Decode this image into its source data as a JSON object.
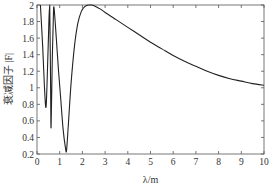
{
  "chart_data": {
    "type": "line",
    "title": "",
    "xlabel": "λ/m",
    "ylabel": "衰减因子 |F|",
    "xlim": [
      0,
      10
    ],
    "ylim": [
      0.2,
      2
    ],
    "xticks": [
      0,
      1,
      2,
      3,
      4,
      5,
      6,
      7,
      8,
      9,
      10
    ],
    "yticks": [
      0.2,
      0.4,
      0.6,
      0.8,
      1,
      1.2,
      1.4,
      1.6,
      1.8,
      2
    ],
    "ytick_labels": [
      "0.2",
      "0.4",
      "0.6",
      "0.8",
      "1",
      "1.2",
      "1.4",
      "1.6",
      "1.8",
      "2"
    ],
    "grid": false,
    "legend": null,
    "series": [
      {
        "name": "|F|",
        "color": "#222222",
        "x": [
          0.15,
          0.25,
          0.33,
          0.4,
          0.47,
          0.53,
          0.56,
          0.6,
          0.62,
          0.67,
          0.72,
          0.75,
          0.85,
          0.95,
          1.05,
          1.15,
          1.25,
          1.3,
          1.38,
          1.5,
          1.65,
          1.8,
          1.95,
          2.1,
          2.25,
          2.4,
          2.6,
          2.8,
          3.0,
          3.5,
          4.0,
          4.5,
          5.0,
          5.5,
          6.0,
          6.5,
          7.0,
          7.5,
          8.0,
          8.5,
          9.0,
          9.5,
          10.0
        ],
        "y": [
          2.0,
          1.5,
          1.0,
          0.77,
          1.3,
          1.85,
          2.0,
          1.0,
          0.52,
          1.3,
          1.85,
          1.97,
          1.6,
          1.2,
          0.85,
          0.5,
          0.28,
          0.24,
          0.55,
          1.05,
          1.5,
          1.78,
          1.92,
          1.98,
          2.0,
          2.0,
          1.98,
          1.95,
          1.91,
          1.82,
          1.73,
          1.64,
          1.55,
          1.47,
          1.39,
          1.32,
          1.26,
          1.2,
          1.15,
          1.11,
          1.08,
          1.05,
          1.03
        ]
      }
    ]
  }
}
